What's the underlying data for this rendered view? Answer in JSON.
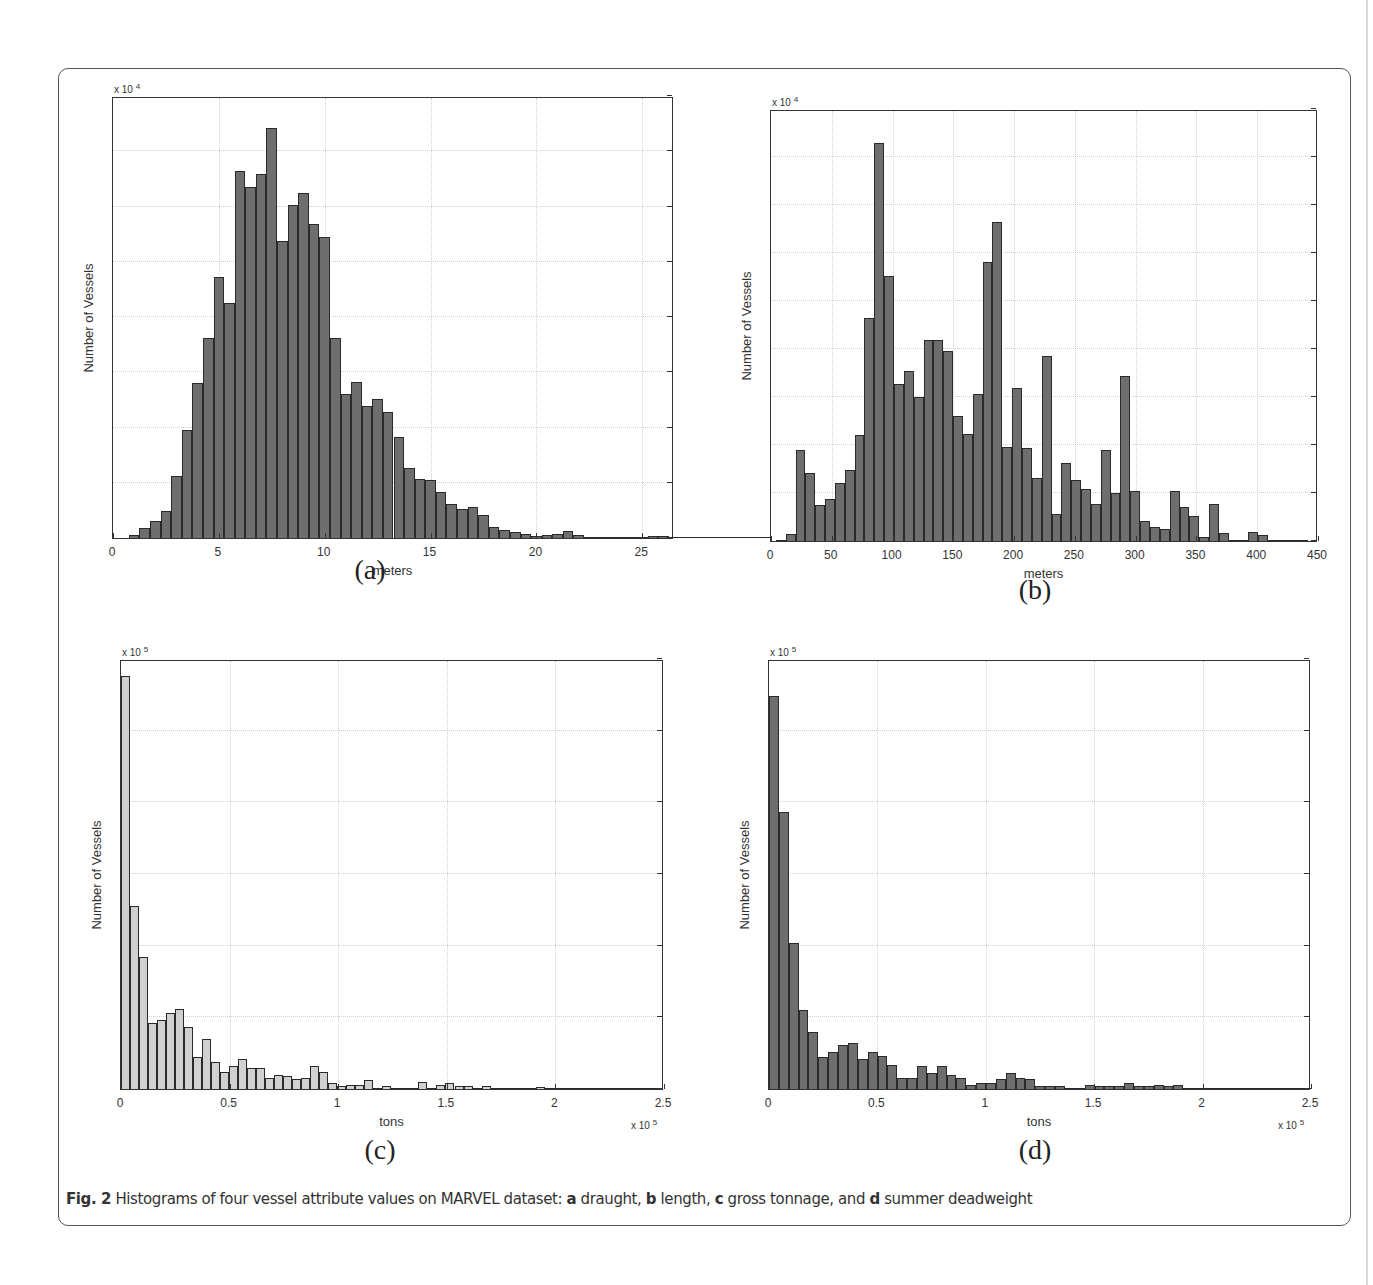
{
  "figure": {
    "caption_prefix": "Fig. 2",
    "caption_text": " Histograms of four vessel attribute values on MARVEL dataset: ",
    "caption_parts": [
      {
        "letter": "a",
        "text": " draught, "
      },
      {
        "letter": "b",
        "text": " length, "
      },
      {
        "letter": "c",
        "text": " gross tonnage, and "
      },
      {
        "letter": "d",
        "text": " summer deadweight"
      }
    ]
  },
  "chart_data": [
    {
      "id": "a",
      "type": "bar",
      "title": "",
      "subfigure_label": "(a)",
      "xlabel": "meters",
      "ylabel": "Number of Vessels",
      "y_multiplier": "x 10",
      "y_multiplier_exp": "4",
      "x_multiplier": "",
      "x_multiplier_exp": "",
      "xlim": [
        0,
        26.5
      ],
      "ylim": [
        0,
        8
      ],
      "xticks": [
        0,
        5,
        10,
        15,
        20,
        25
      ],
      "yticks": [
        0,
        1,
        2,
        3,
        4,
        5,
        6,
        7,
        8
      ],
      "grid": true,
      "bar_color": "#6e6e6e",
      "bin_start": 0.75,
      "bin_width": 0.5,
      "values": [
        0.05,
        0.18,
        0.3,
        0.48,
        1.13,
        1.96,
        2.8,
        3.62,
        4.72,
        4.25,
        6.65,
        6.35,
        6.58,
        7.42,
        5.38,
        6.02,
        6.25,
        5.69,
        5.45,
        3.62,
        2.6,
        2.82,
        2.39,
        2.52,
        2.28,
        1.83,
        1.26,
        1.06,
        1.05,
        0.83,
        0.62,
        0.52,
        0.57,
        0.42,
        0.2,
        0.15,
        0.11,
        0.07,
        0.04,
        0.05,
        0.08,
        0.12,
        0.06,
        0.01,
        0.01,
        0.01,
        0.01,
        0.01,
        0.02,
        0.03,
        0.03,
        0.01,
        0.01,
        0.01,
        0.01,
        0.01,
        0.01,
        0.01,
        0.01,
        0.01,
        0.01,
        0.02,
        0.03,
        0.01
      ]
    },
    {
      "id": "b",
      "type": "bar",
      "title": "",
      "subfigure_label": "(b)",
      "xlabel": "meters",
      "ylabel": "Number of Vessels",
      "y_multiplier": "x 10",
      "y_multiplier_exp": "4",
      "x_multiplier": "",
      "x_multiplier_exp": "",
      "xlim": [
        0,
        450
      ],
      "ylim": [
        0,
        9
      ],
      "xticks": [
        0,
        50,
        100,
        150,
        200,
        250,
        300,
        350,
        400,
        450
      ],
      "yticks": [
        0,
        1,
        2,
        3,
        4,
        5,
        6,
        7,
        8,
        9
      ],
      "grid": true,
      "bar_color": "#6e6e6e",
      "bin_start": 4,
      "bin_width": 8.1,
      "values": [
        0.02,
        0.15,
        1.9,
        1.42,
        0.74,
        0.88,
        1.2,
        1.48,
        2.2,
        4.65,
        8.3,
        5.52,
        3.28,
        3.55,
        3.0,
        4.18,
        4.18,
        3.95,
        2.6,
        2.22,
        3.06,
        5.82,
        6.65,
        1.96,
        3.18,
        1.94,
        1.32,
        3.85,
        0.56,
        1.63,
        1.27,
        1.09,
        0.78,
        1.9,
        0.99,
        3.43,
        1.05,
        0.41,
        0.29,
        0.26,
        1.05,
        0.7,
        0.53,
        0.08,
        0.78,
        0.17,
        0.02,
        0.01,
        0.18,
        0.13,
        0.01,
        0.01,
        0.01,
        0.01
      ]
    },
    {
      "id": "c",
      "type": "bar",
      "title": "",
      "subfigure_label": "(c)",
      "xlabel": "tons",
      "ylabel": "Number of Vessels",
      "y_multiplier": "x 10",
      "y_multiplier_exp": "5",
      "x_multiplier": "x 10",
      "x_multiplier_exp": "5",
      "xlim": [
        0,
        2.5
      ],
      "ylim": [
        0,
        3
      ],
      "xticks": [
        0,
        0.5,
        1,
        1.5,
        2,
        2.5
      ],
      "yticks": [
        0,
        0.5,
        1,
        1.5,
        2,
        2.5,
        3
      ],
      "grid": true,
      "bar_color": "#d0d0d0",
      "bin_start": 0,
      "bin_width": 0.0415,
      "values": [
        2.88,
        1.28,
        0.92,
        0.46,
        0.48,
        0.53,
        0.56,
        0.43,
        0.22,
        0.35,
        0.19,
        0.12,
        0.16,
        0.21,
        0.15,
        0.15,
        0.08,
        0.1,
        0.09,
        0.07,
        0.08,
        0.16,
        0.12,
        0.04,
        0.02,
        0.03,
        0.03,
        0.06,
        0.01,
        0.02,
        0.01,
        0.01,
        0.01,
        0.05,
        0.01,
        0.03,
        0.04,
        0.02,
        0.02,
        0.01,
        0.02,
        0.01,
        0.005,
        0.005,
        0.005,
        0.005,
        0.015,
        0.005,
        0.005,
        0.005,
        0.005,
        0.005,
        0.005,
        0.005,
        0.005,
        0.005,
        0.005,
        0.005,
        0.005,
        0.005
      ]
    },
    {
      "id": "d",
      "type": "bar",
      "title": "",
      "subfigure_label": "(d)",
      "xlabel": "tons",
      "ylabel": "Number of Vessels",
      "y_multiplier": "x 10",
      "y_multiplier_exp": "5",
      "x_multiplier": "x 10",
      "x_multiplier_exp": "5",
      "xlim": [
        0,
        2.5
      ],
      "ylim": [
        0,
        3
      ],
      "xticks": [
        0,
        0.5,
        1,
        1.5,
        2,
        2.5
      ],
      "yticks": [
        0,
        0.5,
        1,
        1.5,
        2,
        2.5,
        3
      ],
      "grid": true,
      "bar_color": "#6e6e6e",
      "bin_start": 0,
      "bin_width": 0.0455,
      "values": [
        2.74,
        1.93,
        1.02,
        0.55,
        0.4,
        0.22,
        0.26,
        0.31,
        0.32,
        0.21,
        0.26,
        0.23,
        0.17,
        0.08,
        0.08,
        0.16,
        0.11,
        0.16,
        0.1,
        0.08,
        0.03,
        0.04,
        0.04,
        0.07,
        0.11,
        0.08,
        0.07,
        0.02,
        0.02,
        0.02,
        0.01,
        0.01,
        0.03,
        0.02,
        0.02,
        0.02,
        0.04,
        0.02,
        0.02,
        0.03,
        0.02,
        0.03,
        0.01,
        0.01,
        0.01,
        0.01,
        0.005,
        0.005,
        0.005,
        0.005,
        0.005,
        0.005,
        0.005,
        0.005,
        0.005
      ]
    }
  ]
}
